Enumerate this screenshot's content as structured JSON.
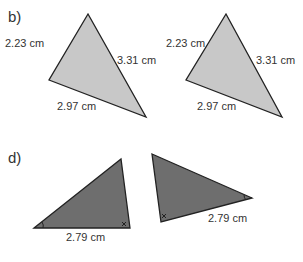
{
  "parts": [
    {
      "label": "b)",
      "triangles": [
        {
          "fill": "#c8c8c8",
          "sides": {
            "left": "2.23 cm",
            "right": "3.31 cm",
            "bottom": "2.97 cm"
          }
        },
        {
          "fill": "#c8c8c8",
          "sides": {
            "left": "2.23 cm",
            "right": "3.31 cm",
            "bottom": "2.97 cm"
          }
        }
      ]
    },
    {
      "label": "d)",
      "triangles": [
        {
          "fill": "#6e6e6e",
          "sides": {
            "bottom": "2.79 cm"
          },
          "angle_marks": [
            "single-arc",
            "double-mark"
          ]
        },
        {
          "fill": "#6e6e6e",
          "sides": {
            "bottom": "2.79 cm"
          },
          "angle_marks": [
            "single-arc",
            "double-mark"
          ]
        }
      ]
    }
  ]
}
